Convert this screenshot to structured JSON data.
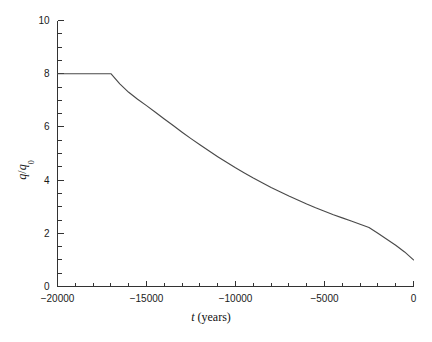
{
  "chart_data": {
    "type": "line",
    "title": "",
    "xlabel": "t (years)",
    "xlabel_italic_part": "t",
    "xlabel_rest": " (years)",
    "ylabel": "q/q0",
    "ylabel_numerator": "q",
    "ylabel_slash": "/",
    "ylabel_denominator": "q",
    "ylabel_subscript": "0",
    "xlim": [
      -20000,
      0
    ],
    "ylim": [
      0,
      10
    ],
    "grid": false,
    "legend": "none",
    "x_tick_labels": [
      "-20000",
      "-15000",
      "-10000",
      "-5000",
      "0"
    ],
    "x_tick_values": [
      -20000,
      -15000,
      -10000,
      -5000,
      0
    ],
    "x_minor_tick_step": 1000,
    "y_tick_labels": [
      "0",
      "2",
      "4",
      "6",
      "8",
      "10"
    ],
    "y_tick_values": [
      0,
      2,
      4,
      6,
      8,
      10
    ],
    "y_minor_tick_step": 0.5,
    "series": [
      {
        "name": "q/q0",
        "x": [
          -20000,
          -19000,
          -18000,
          -17200,
          -17000,
          -16500,
          -16000,
          -15500,
          -15000,
          -14500,
          -14000,
          -13500,
          -13000,
          -12500,
          -12000,
          -11500,
          -11000,
          -10500,
          -10000,
          -9500,
          -9000,
          -8500,
          -8000,
          -7500,
          -7000,
          -6500,
          -6000,
          -5500,
          -5000,
          -4500,
          -4000,
          -3500,
          -3000,
          -2500,
          -2000,
          -1500,
          -1000,
          -500,
          0
        ],
        "y": [
          8.0,
          8.0,
          8.0,
          8.0,
          8.0,
          7.62,
          7.3,
          7.04,
          6.8,
          6.55,
          6.3,
          6.05,
          5.8,
          5.56,
          5.33,
          5.1,
          4.88,
          4.67,
          4.46,
          4.27,
          4.08,
          3.9,
          3.72,
          3.56,
          3.4,
          3.25,
          3.1,
          2.96,
          2.83,
          2.7,
          2.58,
          2.46,
          2.34,
          2.22,
          2.0,
          1.78,
          1.55,
          1.3,
          1.0
        ]
      }
    ],
    "annotations": [
      {
        "text": "plateau at q/q0 = 8 from t = -20000 to t = -17000"
      },
      {
        "text": "monotonic decay from 8 to 1 between t = -17000 and t = 0"
      }
    ],
    "colors": {
      "curve": "#4a4a4a",
      "axis": "#333333",
      "text": "#1a1a1a",
      "background": "#ffffff"
    }
  }
}
